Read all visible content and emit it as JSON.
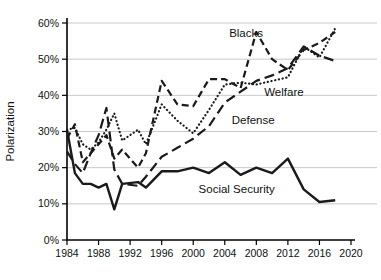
{
  "chart_data": {
    "type": "line",
    "title": "",
    "xlabel": "",
    "ylabel": "Polarization",
    "xlim": [
      1984,
      2020
    ],
    "ylim": [
      0,
      60
    ],
    "grid": "horizontal",
    "grid_color": "#c9c9c9",
    "axis_color": "#000000",
    "line_color": "#1a1a1a",
    "legend_position": "inline-annotations",
    "x_ticks": [
      1984,
      1988,
      1992,
      1996,
      2000,
      2004,
      2008,
      2012,
      2016,
      2020
    ],
    "x_tick_labels": [
      "1984",
      "1988",
      "1992",
      "1996",
      "2000",
      "2004",
      "2008",
      "2012",
      "2016",
      "2020"
    ],
    "y_ticks": [
      0,
      10,
      20,
      30,
      40,
      50,
      60
    ],
    "y_tick_labels": [
      "0%",
      "10%",
      "20%",
      "30%",
      "40%",
      "50%",
      "60%"
    ],
    "x": [
      1984,
      1985,
      1986,
      1987,
      1988,
      1989,
      1990,
      1991,
      1993,
      1994,
      1996,
      1998,
      2000,
      2002,
      2004,
      2006,
      2008,
      2010,
      2012,
      2014,
      2016,
      2018
    ],
    "series": [
      {
        "name": "Blacks",
        "style": "dashed",
        "values": [
          28,
          32,
          21.5,
          24,
          26.5,
          29,
          22.5,
          25,
          20,
          24,
          44,
          37.5,
          37,
          44.5,
          44.5,
          42,
          57.5,
          50,
          47,
          52.5,
          54.5,
          57.5
        ]
      },
      {
        "name": "Welfare",
        "style": "dotted",
        "values": [
          30.5,
          31,
          26.5,
          25,
          27,
          30.5,
          35,
          27.5,
          30.5,
          26.5,
          37.5,
          33,
          29.5,
          36,
          43,
          43.5,
          43,
          44,
          45,
          53.5,
          50.5,
          58.5
        ]
      },
      {
        "name": "Defense",
        "style": "long-dashed",
        "values": [
          24.5,
          21,
          18.5,
          24,
          29,
          36.5,
          19.5,
          15.5,
          15,
          17.5,
          23,
          25.5,
          28,
          31.5,
          38,
          41,
          44,
          45.5,
          47.5,
          53.5,
          51,
          49.5
        ]
      },
      {
        "name": "Social Security",
        "style": "solid",
        "values": [
          30.5,
          18.5,
          15.5,
          15.5,
          14.5,
          15.5,
          8.5,
          15.5,
          16,
          14.5,
          19,
          19,
          20,
          18.5,
          21.5,
          18,
          20,
          18.5,
          22.5,
          14,
          10.5,
          11
        ]
      }
    ],
    "annotations": [
      {
        "text": "Blacks",
        "year": 2006.7,
        "value": 57.2
      },
      {
        "text": "Welfare",
        "year": 2011.5,
        "value": 40.8
      },
      {
        "text": "Defense",
        "year": 2007.6,
        "value": 33.3
      },
      {
        "text": "Social Security",
        "year": 2005.5,
        "value": 14.1
      }
    ]
  }
}
